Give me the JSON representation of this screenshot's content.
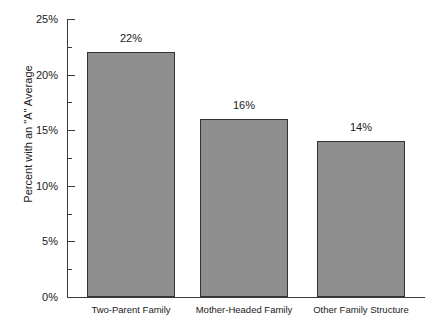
{
  "chart_data": {
    "type": "bar",
    "title": "",
    "xlabel": "",
    "ylabel": "Percent with an \"A\" Average",
    "categories": [
      "Two-Parent Family",
      "Mother-Headed Family",
      "Other Family Structure"
    ],
    "values": [
      22,
      16,
      14
    ],
    "value_labels": [
      "22%",
      "16%",
      "14%"
    ],
    "ylim": [
      0,
      25
    ],
    "ytick_values": [
      0,
      5,
      10,
      15,
      20,
      25
    ],
    "ytick_labels": [
      "0%",
      "5%",
      "10%",
      "15%",
      "20%",
      "25%"
    ],
    "yminor_tick_values": [
      2.5,
      7.5,
      12.5,
      17.5,
      22.5
    ],
    "grid": false,
    "legend": null,
    "series": [
      {
        "name": "Percent with an \"A\" Average",
        "values": [
          22,
          16,
          14
        ]
      }
    ],
    "colors": {
      "bar_fill": "#8e8e8e",
      "bar_border": "#333333",
      "axis": "#3a3a3a",
      "text": "#1a1a1a",
      "background": "#ffffff"
    }
  }
}
